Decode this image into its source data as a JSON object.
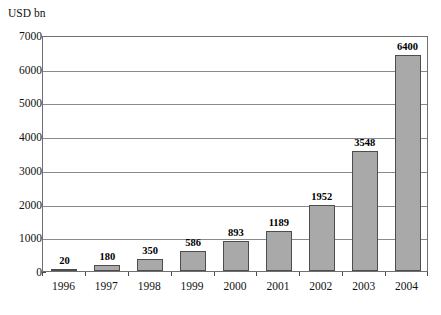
{
  "chart_data": {
    "type": "bar",
    "title": "",
    "subtitle": "",
    "xlabel": "",
    "ylabel": "USD bn",
    "categories": [
      "1996",
      "1997",
      "1998",
      "1999",
      "2000",
      "2001",
      "2002",
      "2003",
      "2004"
    ],
    "values": [
      20,
      180,
      350,
      586,
      893,
      1189,
      1952,
      3548,
      6400
    ],
    "data_labels": [
      "20",
      "180",
      "350",
      "586",
      "893",
      "1189",
      "1952",
      "3548",
      "6400"
    ],
    "ylim": [
      0,
      7000
    ],
    "ytick_values": [
      0,
      1000,
      2000,
      3000,
      4000,
      5000,
      6000,
      7000
    ],
    "ytick_labels": [
      "0",
      "1000",
      "2000",
      "3000",
      "4000",
      "5000",
      "6000",
      "7000"
    ],
    "grid": "horizontal",
    "legend": "none",
    "bar_color": "#a9a9a9",
    "bar_border_color": "#4d4d4d",
    "gridline_color": "#8a8a8a",
    "axis_color": "#6f6f6f",
    "background_color": "#ffffff"
  }
}
